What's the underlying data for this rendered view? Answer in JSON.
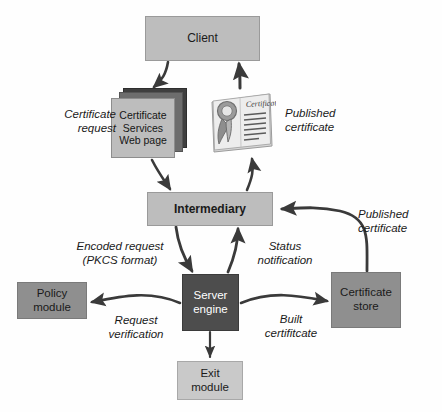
{
  "diagram": {
    "colors": {
      "client_fill": "#bdbdbd",
      "intermediary_fill": "#bdbdbd",
      "server_engine_fill": "#4d4d4d",
      "server_engine_text": "#ffffff",
      "policy_module_fill": "#8f8f8f",
      "certificate_store_fill": "#8f8f8f",
      "exit_module_fill": "#c9c9c9",
      "webpage_front_fill": "#bdbdbd",
      "webpage_shadow_fill": "#3f3f3f",
      "arrow_stroke": "#3a3a3a",
      "background": "#ffffff"
    },
    "nodes": [
      {
        "id": "client",
        "label": "Client"
      },
      {
        "id": "certificate-services-web-page",
        "label": "Certificate\nServices\nWeb page"
      },
      {
        "id": "published-certificate-art",
        "label": "Certificate"
      },
      {
        "id": "intermediary",
        "label": "Intermediary"
      },
      {
        "id": "server-engine",
        "label": "Server\nengine"
      },
      {
        "id": "policy-module",
        "label": "Policy\nmodule"
      },
      {
        "id": "certificate-store",
        "label": "Certificate\nstore"
      },
      {
        "id": "exit-module",
        "label": "Exit\nmodule"
      }
    ],
    "edge_labels": [
      {
        "id": "certificate-request",
        "label": "Certificate\nrequest"
      },
      {
        "id": "published-certificate-top",
        "label": "Published\ncertificate"
      },
      {
        "id": "encoded-request",
        "label": "Encoded request\n(PKCS format)"
      },
      {
        "id": "status-notification",
        "label": "Status\nnotification"
      },
      {
        "id": "published-certificate-right",
        "label": "Published\ncertificate"
      },
      {
        "id": "request-verification",
        "label": "Request\nverification"
      },
      {
        "id": "built-certificate",
        "label": "Built\ncertifitcate"
      }
    ]
  }
}
